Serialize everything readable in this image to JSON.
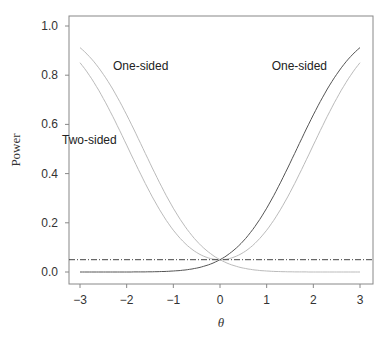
{
  "chart_data": {
    "type": "line",
    "title": "",
    "xlabel": "θ",
    "ylabel": "Power",
    "xlim": [
      -3,
      3
    ],
    "ylim": [
      0,
      1
    ],
    "x_ticks": [
      -3,
      -2,
      -1,
      0,
      1,
      2,
      3
    ],
    "x_tick_labels": [
      "−3",
      "−2",
      "−1",
      "0",
      "1",
      "2",
      "3"
    ],
    "y_ticks": [
      0.0,
      0.2,
      0.4,
      0.6,
      0.8,
      1.0
    ],
    "y_tick_labels": [
      "0.0",
      "0.2",
      "0.4",
      "0.6",
      "0.8",
      "1.0"
    ],
    "grid": false,
    "legend": null,
    "x": [
      -3,
      -2.5,
      -2,
      -1.5,
      -1,
      -0.5,
      0,
      0.5,
      1,
      1.5,
      2,
      2.5,
      3
    ],
    "series": [
      {
        "name": "One-sided (θ > 0 alternative)",
        "color": "#555555",
        "values": [
          0.0,
          0.0,
          0.0,
          0.0,
          0.0,
          0.01,
          0.05,
          0.13,
          0.26,
          0.44,
          0.64,
          0.8,
          0.91
        ]
      },
      {
        "name": "One-sided (θ < 0 alternative)",
        "color": "#bbbbbb",
        "values": [
          0.91,
          0.8,
          0.64,
          0.44,
          0.26,
          0.13,
          0.05,
          0.01,
          0.0,
          0.0,
          0.0,
          0.0,
          0.0
        ]
      },
      {
        "name": "Two-sided",
        "color": "#bbbbbb",
        "values": [
          0.85,
          0.71,
          0.52,
          0.32,
          0.17,
          0.08,
          0.05,
          0.08,
          0.17,
          0.32,
          0.52,
          0.71,
          0.85
        ]
      },
      {
        "name": "Significance level α",
        "color": "#444444",
        "style": "dash-dot",
        "values": [
          0.05,
          0.05,
          0.05,
          0.05,
          0.05,
          0.05,
          0.05,
          0.05,
          0.05,
          0.05,
          0.05,
          0.05,
          0.05
        ]
      }
    ],
    "annotations": [
      {
        "text": "One-sided",
        "x": -1.7,
        "y": 0.82
      },
      {
        "text": "One-sided",
        "x": 1.7,
        "y": 0.82
      },
      {
        "text": "Two-sided",
        "x": -2.8,
        "y": 0.52
      }
    ]
  }
}
